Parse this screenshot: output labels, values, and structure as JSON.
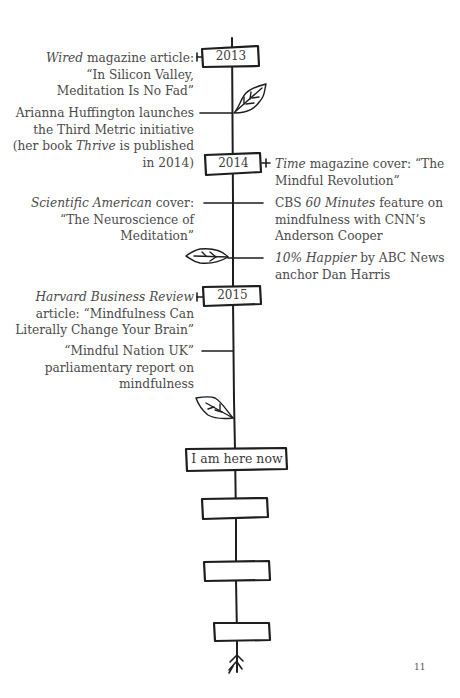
{
  "page_number": "11",
  "timeline": {
    "years": [
      {
        "label": "2013"
      },
      {
        "label": "2014"
      },
      {
        "label": "2015"
      }
    ],
    "present_marker": "I am here now",
    "empty_boxes": 3
  },
  "events": {
    "wired": {
      "italic": "Wired",
      "line1_rest": " magazine article:",
      "line2": "“In Silicon Valley,",
      "line3": "Meditation Is No Fad”"
    },
    "huffington": {
      "line1": "Arianna Huffington launches",
      "line2": "the Third Metric initiative",
      "line3_pre": "(her book ",
      "line3_italic": "Thrive",
      "line3_post": " is published",
      "line4": "in 2014)"
    },
    "time": {
      "italic": "Time",
      "line1_rest": " magazine cover: “The",
      "line2": "Mindful Revolution”"
    },
    "sciam": {
      "italic": "Scientific American",
      "line1_rest": " cover:",
      "line2": "“The Neuroscience of",
      "line3": "Meditation”"
    },
    "cbs": {
      "pre": "CBS ",
      "italic": "60 Minutes",
      "line1_rest": " feature on",
      "line2": "mindfulness with CNN’s",
      "line3": "Anderson Cooper"
    },
    "happier": {
      "italic": "10% Happier",
      "line1_rest": " by ABC News",
      "line2": "anchor Dan Harris"
    },
    "hbr": {
      "italic": "Harvard Business Review",
      "line2": "article: “Mindfulness Can",
      "line3": "Literally Change Your Brain”"
    },
    "mindful_nation": {
      "line1": "“Mindful Nation UK”",
      "line2": "parliamentary report on",
      "line3": "mindfulness"
    }
  }
}
